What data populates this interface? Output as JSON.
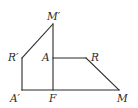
{
  "diagram": {
    "type": "geometric-figure",
    "points": {
      "M_prime": {
        "label": "M′",
        "x": 53,
        "y": 24
      },
      "R_prime": {
        "label": "R′",
        "x": 22,
        "y": 58
      },
      "A_prime": {
        "label": "A′",
        "x": 22,
        "y": 90
      },
      "A": {
        "label": "A",
        "x": 53,
        "y": 58
      },
      "R": {
        "label": "R",
        "x": 86,
        "y": 58
      },
      "M": {
        "label": "M",
        "x": 119,
        "y": 90
      },
      "F": {
        "label": "F",
        "x": 53,
        "y": 90
      }
    },
    "labels": {
      "M_prime": "M′",
      "R_prime": "R′",
      "A_prime": "A′",
      "A": "A",
      "R": "R",
      "M": "M",
      "F": "F"
    },
    "segments": [
      [
        "F",
        "M_prime"
      ],
      [
        "M_prime",
        "R_prime"
      ],
      [
        "R_prime",
        "A_prime"
      ],
      [
        "A_prime",
        "M"
      ],
      [
        "A",
        "R"
      ],
      [
        "R",
        "M"
      ]
    ],
    "colors": {
      "stroke": "#2a2a2a",
      "background": "#ffffff"
    }
  }
}
